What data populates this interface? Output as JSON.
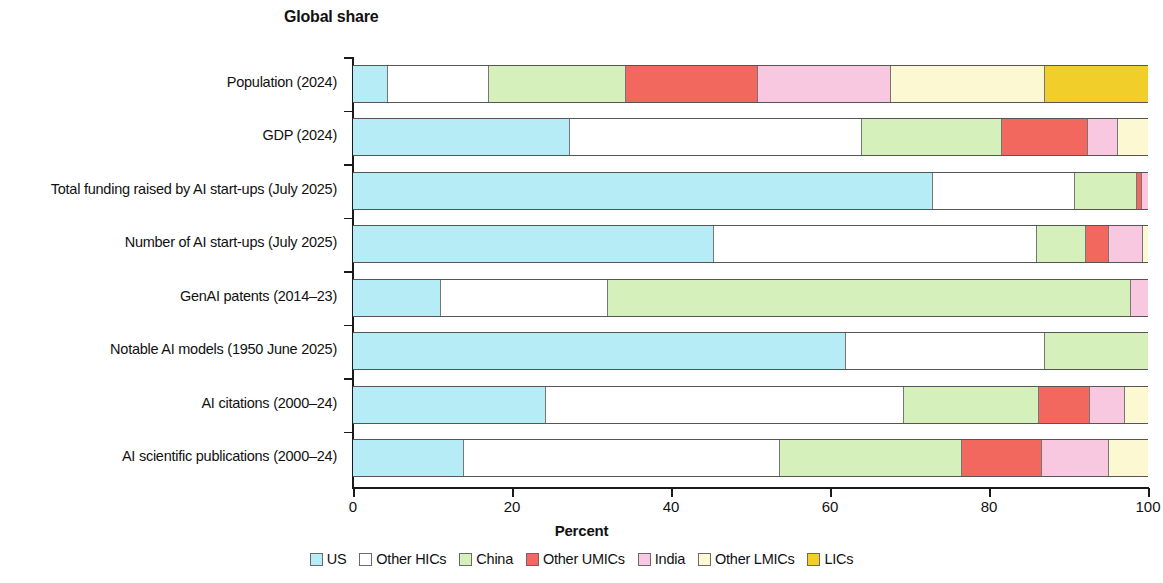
{
  "header": {
    "title": "Global share"
  },
  "axis": {
    "x_title": "Percent",
    "x_ticks": [
      "0",
      "20",
      "40",
      "60",
      "80",
      "100"
    ]
  },
  "legend": {
    "items": [
      {
        "label": "US",
        "color": "#b6ecf5"
      },
      {
        "label": "Other HICs",
        "color": "#ffffff"
      },
      {
        "label": "China",
        "color": "#d6f0bc"
      },
      {
        "label": "Other UMICs",
        "color": "#f2685f"
      },
      {
        "label": "India",
        "color": "#f7c8e0"
      },
      {
        "label": "Other LMICs",
        "color": "#fcf8d2"
      },
      {
        "label": "LICs",
        "color": "#f2ce2b"
      }
    ]
  },
  "chart_data": {
    "type": "bar",
    "orientation": "horizontal",
    "stacked": true,
    "title": "Global share",
    "xlabel": "Percent",
    "ylabel": "",
    "xlim": [
      0,
      100
    ],
    "xticks": [
      0,
      20,
      40,
      60,
      80,
      100
    ],
    "grid": false,
    "legend_position": "bottom",
    "series": [
      {
        "name": "US",
        "color": "#b6ecf5",
        "values": [
          4.4,
          27.3,
          72.9,
          45.4,
          11.1,
          62.0,
          24.3,
          14.0
        ]
      },
      {
        "name": "Other HICs",
        "color": "#ffffff",
        "values": [
          12.7,
          36.7,
          17.9,
          40.6,
          21.0,
          25.0,
          45.0,
          39.7
        ]
      },
      {
        "name": "China",
        "color": "#d6f0bc",
        "values": [
          17.3,
          17.6,
          7.8,
          6.2,
          65.8,
          13.0,
          17.0,
          22.9
        ]
      },
      {
        "name": "Other UMICs",
        "color": "#f2685f",
        "values": [
          16.5,
          10.9,
          0.7,
          2.9,
          0.0,
          0.0,
          6.4,
          10.1
        ]
      },
      {
        "name": "India",
        "color": "#f7c8e0",
        "values": [
          16.8,
          3.7,
          0.7,
          4.3,
          2.1,
          0.0,
          4.4,
          8.4
        ]
      },
      {
        "name": "Other LMICs",
        "color": "#fcf8d2",
        "values": [
          19.3,
          3.8,
          0.0,
          0.6,
          0.0,
          0.0,
          2.9,
          4.9
        ]
      },
      {
        "name": "LICs",
        "color": "#f2ce2b",
        "values": [
          13.0,
          0.0,
          0.0,
          0.0,
          0.0,
          0.0,
          0.0,
          0.0
        ]
      }
    ],
    "categories": [
      "Population (2024)",
      "GDP (2024)",
      "Total funding raised by AI start-ups (July 2025)",
      "Number of AI start-ups (July 2025)",
      "GenAI patents (2014–23)",
      "Notable AI models (1950 June 2025)",
      "AI citations (2000–24)",
      "AI scientific publications (2000–24)"
    ]
  }
}
